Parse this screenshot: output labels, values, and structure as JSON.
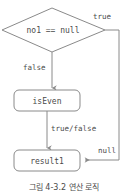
{
  "figure": {
    "caption": "그림 4-3.2 연산 로직",
    "colors": {
      "stroke": "#8a8a8a",
      "text": "#4a4a4a",
      "background": "#ffffff"
    }
  },
  "nodes": {
    "decision": {
      "label": "no1 == null",
      "shape": "diamond"
    },
    "process": {
      "label": "isEven",
      "shape": "rounded-rectangle"
    },
    "result": {
      "label": "result1",
      "shape": "rounded-rectangle"
    }
  },
  "edges": {
    "true_branch": {
      "label": "true"
    },
    "false_branch": {
      "label": "false"
    },
    "process_out": {
      "label": "true/false"
    },
    "null_in": {
      "label": "null"
    }
  }
}
